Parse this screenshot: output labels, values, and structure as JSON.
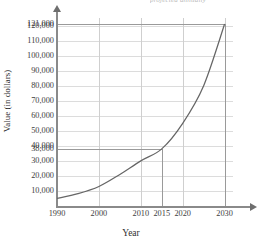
{
  "chart_data": {
    "type": "line",
    "title": "",
    "clipped_header": "projected annually",
    "xlabel": "Year",
    "ylabel": "Value (in dollars)",
    "xlim": [
      1990,
      2032
    ],
    "ylim": [
      0,
      125000
    ],
    "grid": true,
    "legend": "none",
    "x_ticks": [
      {
        "value": 1990,
        "label": "1990"
      },
      {
        "value": 2000,
        "label": "2000"
      },
      {
        "value": 2010,
        "label": "2010"
      },
      {
        "value": 2015,
        "label": "2015"
      },
      {
        "value": 2020,
        "label": "2020"
      },
      {
        "value": 2030,
        "label": "2030"
      }
    ],
    "y_ticks": [
      {
        "value": 121000,
        "label": "121,000"
      },
      {
        "value": 120000,
        "label": "120,000"
      },
      {
        "value": 110000,
        "label": "110,000"
      },
      {
        "value": 100000,
        "label": "100,000"
      },
      {
        "value": 90000,
        "label": "90,000"
      },
      {
        "value": 80000,
        "label": "80,000"
      },
      {
        "value": 70000,
        "label": "70,000"
      },
      {
        "value": 60000,
        "label": "60,000"
      },
      {
        "value": 50000,
        "label": "50,000"
      },
      {
        "value": 40000,
        "label": "40,000"
      },
      {
        "value": 38000,
        "label": "38,000"
      },
      {
        "value": 30000,
        "label": "30,000"
      },
      {
        "value": 20000,
        "label": "20,000"
      },
      {
        "value": 10000,
        "label": "10,000"
      }
    ],
    "gridlines_y": [
      120000,
      110000,
      100000,
      90000,
      80000,
      70000,
      60000,
      50000,
      40000,
      30000,
      20000,
      10000
    ],
    "gridlines_x": [
      2000,
      2010,
      2020,
      2030
    ],
    "series": [
      {
        "name": "value",
        "color": "#666666",
        "x": [
          1990,
          1995,
          2000,
          2005,
          2010,
          2015,
          2020,
          2025,
          2030
        ],
        "values": [
          5000,
          8200,
          13000,
          21000,
          30000,
          38000,
          55000,
          80000,
          121000
        ]
      }
    ],
    "annotations": [
      {
        "name": "projection-2015",
        "x": 2015,
        "y": 38000,
        "label": "38,000"
      },
      {
        "name": "projection-2030",
        "x": 2030,
        "y": 121000,
        "label": "121,000"
      }
    ]
  }
}
